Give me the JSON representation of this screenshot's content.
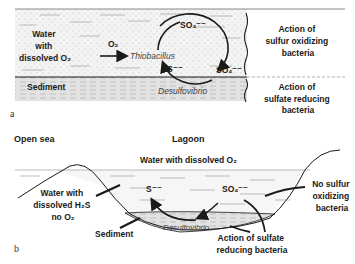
{
  "panel_a": {
    "letter": "a",
    "water_label": [
      "Water",
      "with",
      "dissolved O₂"
    ],
    "o2_label": "O₂",
    "thiobacillus": "Thiobacillus",
    "sulfate_top": "SO₄⁻⁻",
    "sulfate_right": "SO₄⁻⁻",
    "sulfide": "S⁻⁻",
    "desulfovibrio": "Desulfovibrio",
    "sediment_label": "Sediment",
    "action_oxidizing": [
      "Action of",
      "sulfur oxidizing",
      "bacteria"
    ],
    "action_reducing": [
      "Action of",
      "sulfate reducing",
      "bacteria"
    ]
  },
  "panel_b": {
    "letter": "b",
    "open_sea": "Open sea",
    "lagoon": "Lagoon",
    "water_o2": "Water with dissolved O₂",
    "water_h2s": [
      "Water with",
      "dissolved H₂S",
      "no O₂"
    ],
    "sulfide": "S⁻⁻",
    "sulfate": "SO₄⁻⁻",
    "desulfovibrio": "Desulfovibrio",
    "sediment_label": "Sediment",
    "no_sulfur": [
      "No sulfur",
      "oxidizing",
      "bacteria"
    ],
    "action_reducing": [
      "Action of sulfate",
      "reducing bacteria"
    ]
  },
  "colors": {
    "ink": "#1a1a1a",
    "water_stipple": "#e6e6e6",
    "sediment": "#d9d9d9",
    "dash": "#9a9a9a"
  }
}
